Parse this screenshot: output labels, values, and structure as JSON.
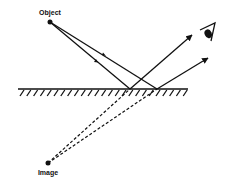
{
  "diagram": {
    "labels": {
      "object": "Object",
      "image": "Image"
    },
    "colors": {
      "line": "#111111",
      "background": "#ffffff"
    },
    "points": {
      "object": [
        50,
        22
      ],
      "image": [
        48,
        163
      ],
      "reflection_1": [
        130,
        89
      ],
      "reflection_2": [
        157,
        89
      ],
      "eye": [
        210,
        32
      ]
    },
    "mirror": {
      "x1": 18,
      "x2": 188,
      "y": 89,
      "hatch_count": 25
    },
    "icons": [
      "eye-icon"
    ]
  }
}
